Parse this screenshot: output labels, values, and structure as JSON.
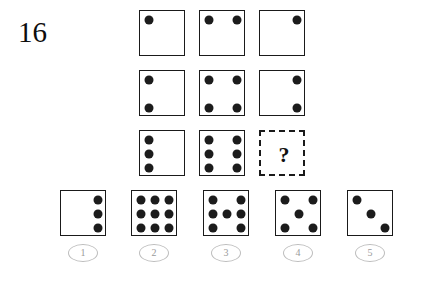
{
  "item": {
    "number": "16",
    "question_mark": "?"
  },
  "matrix": {
    "rows": 3,
    "cols": 3,
    "cells": [
      {
        "name": "matrix-cell-r1c1",
        "row": 1,
        "col": 1,
        "style": "solid",
        "dot_count": 1,
        "dots": [
          [
            9,
            9
          ]
        ]
      },
      {
        "name": "matrix-cell-r1c2",
        "row": 1,
        "col": 2,
        "style": "solid",
        "dot_count": 2,
        "dots": [
          [
            9,
            9
          ],
          [
            37,
            9
          ]
        ]
      },
      {
        "name": "matrix-cell-r1c3",
        "row": 1,
        "col": 3,
        "style": "solid",
        "dot_count": 1,
        "dots": [
          [
            37,
            9
          ]
        ]
      },
      {
        "name": "matrix-cell-r2c1",
        "row": 2,
        "col": 1,
        "style": "solid",
        "dot_count": 2,
        "dots": [
          [
            9,
            9
          ],
          [
            9,
            37
          ]
        ]
      },
      {
        "name": "matrix-cell-r2c2",
        "row": 2,
        "col": 2,
        "style": "solid",
        "dot_count": 4,
        "dots": [
          [
            9,
            9
          ],
          [
            37,
            9
          ],
          [
            9,
            37
          ],
          [
            37,
            37
          ]
        ]
      },
      {
        "name": "matrix-cell-r2c3",
        "row": 2,
        "col": 3,
        "style": "solid",
        "dot_count": 2,
        "dots": [
          [
            37,
            9
          ],
          [
            37,
            37
          ]
        ]
      },
      {
        "name": "matrix-cell-r3c1",
        "row": 3,
        "col": 1,
        "style": "solid",
        "dot_count": 3,
        "dots": [
          [
            9,
            9
          ],
          [
            9,
            23
          ],
          [
            9,
            37
          ]
        ]
      },
      {
        "name": "matrix-cell-r3c2",
        "row": 3,
        "col": 2,
        "style": "solid",
        "dot_count": 6,
        "dots": [
          [
            9,
            9
          ],
          [
            9,
            23
          ],
          [
            9,
            37
          ],
          [
            37,
            9
          ],
          [
            37,
            23
          ],
          [
            37,
            37
          ]
        ]
      },
      {
        "name": "matrix-cell-r3c3",
        "row": 3,
        "col": 3,
        "style": "dashed",
        "dot_count": 0,
        "dots": [],
        "is_answer_slot": true
      }
    ]
  },
  "options": [
    {
      "label": "1",
      "name": "answer-option-1",
      "dot_count": 3,
      "dots": [
        [
          37,
          9
        ],
        [
          37,
          23
        ],
        [
          37,
          37
        ]
      ]
    },
    {
      "label": "2",
      "name": "answer-option-2",
      "dot_count": 9,
      "dots": [
        [
          9,
          9
        ],
        [
          23,
          9
        ],
        [
          37,
          9
        ],
        [
          9,
          23
        ],
        [
          23,
          23
        ],
        [
          37,
          23
        ],
        [
          9,
          37
        ],
        [
          23,
          37
        ],
        [
          37,
          37
        ]
      ]
    },
    {
      "label": "3",
      "name": "answer-option-3",
      "dot_count": 7,
      "dots": [
        [
          9,
          9
        ],
        [
          37,
          9
        ],
        [
          9,
          23
        ],
        [
          23,
          23
        ],
        [
          37,
          23
        ],
        [
          9,
          37
        ],
        [
          37,
          37
        ]
      ]
    },
    {
      "label": "4",
      "name": "answer-option-4",
      "dot_count": 5,
      "dots": [
        [
          9,
          9
        ],
        [
          37,
          9
        ],
        [
          23,
          23
        ],
        [
          9,
          37
        ],
        [
          37,
          37
        ]
      ]
    },
    {
      "label": "5",
      "name": "answer-option-5",
      "dot_count": 3,
      "dots": [
        [
          9,
          9
        ],
        [
          23,
          23
        ],
        [
          37,
          37
        ]
      ]
    }
  ],
  "layout": {
    "matrix_left": 139,
    "matrix_top": 10,
    "cell_size": 46,
    "cell_gap": 14,
    "option_lefts": [
      60,
      131,
      203,
      275,
      347
    ],
    "options_top": 190
  },
  "colors": {
    "background": "#ffffff",
    "dot": "#1c1c1c",
    "box_border": "#1a1a1a",
    "label_circle": "#bdbdbd",
    "label_text": "#9a9a9a",
    "item_number": "#0d0d0d"
  }
}
